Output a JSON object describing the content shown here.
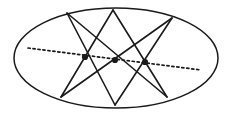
{
  "figure": {
    "background_color": "#ffffff",
    "ink_color": "#1a1a1a"
  },
  "chart_data": {
    "type": "scatter",
    "subtitle": "",
    "xlabel": "",
    "ylabel": "",
    "xlim": [
      0,
      231
    ],
    "ylim": [
      0,
      115
    ],
    "grid": false,
    "legend": "none",
    "coordinate_note": "Pixel coordinates, origin at top-left of a 231x115 image.",
    "conic": {
      "shape": "ellipse",
      "center_x": 116,
      "center_y": 58,
      "radius_x": 102,
      "radius_y": 50,
      "stroke_width": 1.5,
      "fill": "none"
    },
    "inscribed_points": [
      {
        "label": "A",
        "position": "top-left",
        "x": 67,
        "y": 13
      },
      {
        "label": "B",
        "position": "top-center",
        "x": 113,
        "y": 10
      },
      {
        "label": "C",
        "position": "top-right",
        "x": 172,
        "y": 18
      },
      {
        "label": "D",
        "position": "bottom-right",
        "x": 167,
        "y": 97
      },
      {
        "label": "E",
        "position": "bottom-center",
        "x": 115,
        "y": 105
      },
      {
        "label": "F",
        "position": "bottom-left",
        "x": 61,
        "y": 97
      }
    ],
    "chords": [
      {
        "name": "AE",
        "from": "A",
        "to": "E",
        "x1": 67,
        "y1": 13,
        "x2": 115,
        "y2": 105
      },
      {
        "name": "AD",
        "from": "A",
        "to": "D",
        "x1": 67,
        "y1": 13,
        "x2": 167,
        "y2": 97
      },
      {
        "name": "BF",
        "from": "B",
        "to": "F",
        "x1": 113,
        "y1": 10,
        "x2": 61,
        "y2": 97
      },
      {
        "name": "BD",
        "from": "B",
        "to": "D",
        "x1": 113,
        "y1": 10,
        "x2": 167,
        "y2": 97
      },
      {
        "name": "CF",
        "from": "C",
        "to": "F",
        "x1": 172,
        "y1": 18,
        "x2": 61,
        "y2": 97
      },
      {
        "name": "CE",
        "from": "C",
        "to": "E",
        "x1": 172,
        "y1": 18,
        "x2": 115,
        "y2": 105
      }
    ],
    "intersection_nodes": [
      {
        "label": "P",
        "x": 85,
        "y": 57,
        "radius": 3.1
      },
      {
        "label": "Q",
        "x": 115,
        "y": 60,
        "radius": 3.1
      },
      {
        "label": "R",
        "x": 145,
        "y": 62,
        "radius": 3.1
      }
    ],
    "pascal_line": {
      "style": "dashed",
      "x1": 28,
      "y1": 48,
      "x2": 201,
      "y2": 70,
      "dash_pattern": "2.2 2.8",
      "stroke_width": 1.7,
      "collinear_points": [
        "P",
        "Q",
        "R"
      ]
    }
  }
}
